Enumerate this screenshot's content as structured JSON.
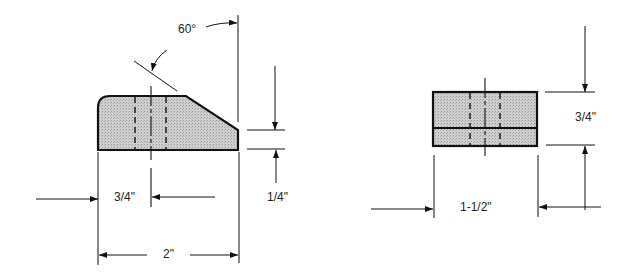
{
  "colors": {
    "fill": "#c9c9c9",
    "stroke": "#111111",
    "background": "#ffffff"
  },
  "left_view": {
    "angle_label": "60°",
    "hole_offset_label": "3/4\"",
    "width_label": "2\"",
    "chamfer_height_label": "1/4\""
  },
  "right_view": {
    "height_label": "3/4\"",
    "width_label": "1-1/2\""
  }
}
